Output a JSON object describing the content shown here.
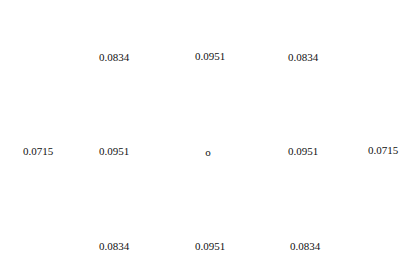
{
  "kernel": {
    "rows": [
      [
        {
          "value": "0.0834",
          "x": 114,
          "y": 57
        },
        {
          "value": "0.0951",
          "x": 210,
          "y": 56
        },
        {
          "value": "0.0834",
          "x": 303,
          "y": 57
        }
      ],
      [
        {
          "value": "0.0715",
          "x": 38,
          "y": 151
        },
        {
          "value": "0.0951",
          "x": 114,
          "y": 151
        },
        {
          "value": "o",
          "x": 208,
          "y": 152
        },
        {
          "value": "0.0951",
          "x": 303,
          "y": 151
        },
        {
          "value": "0.0715",
          "x": 383,
          "y": 150
        }
      ],
      [
        {
          "value": "0.0834",
          "x": 114,
          "y": 246
        },
        {
          "value": "0.0951",
          "x": 210,
          "y": 246
        },
        {
          "value": "0.0834",
          "x": 305,
          "y": 246
        }
      ]
    ],
    "text_color": "#111111",
    "background": "#ffffff"
  }
}
